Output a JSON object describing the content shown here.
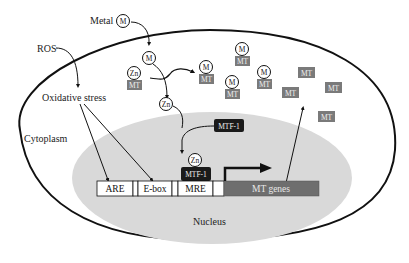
{
  "diagram": {
    "labels": {
      "metal": "Metal",
      "ros": "ROS",
      "oxidative_stress": "Oxidative stress",
      "cytoplasm": "Cytoplasm",
      "nucleus": "Nucleus"
    },
    "symbols": {
      "metal": "M",
      "zinc": "Zn",
      "mt": "MT",
      "mtf1": "MTF-1"
    },
    "promoter": {
      "elements": [
        "ARE",
        "E-box",
        "MRE"
      ],
      "gene": "MT genes"
    },
    "colors": {
      "mt_box": "#7a7a7a",
      "mtf1_box": "#1a1a1a",
      "nucleus_fill": "#d9d9d9",
      "gene_box": "#6e6e6e",
      "outline": "#111111"
    }
  }
}
